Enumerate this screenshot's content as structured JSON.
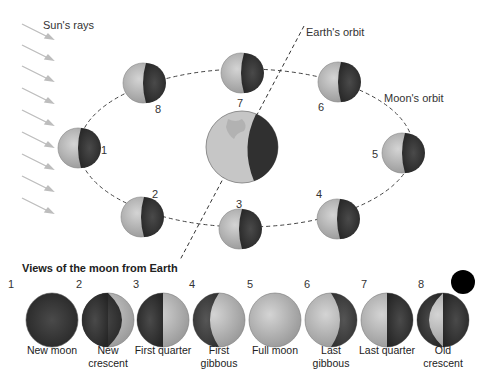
{
  "labels": {
    "suns_rays": "Sun's rays",
    "earths_orbit": "Earth's orbit",
    "moons_orbit": "Moon's orbit"
  },
  "orbit_positions": [
    {
      "number": "1",
      "lit_side": "left-half"
    },
    {
      "number": "2",
      "lit_side": "left-half"
    },
    {
      "number": "3",
      "lit_side": "left-half"
    },
    {
      "number": "4",
      "lit_side": "left-half"
    },
    {
      "number": "5",
      "lit_side": "left-half"
    },
    {
      "number": "6",
      "lit_side": "left-half"
    },
    {
      "number": "7",
      "lit_side": "left-half"
    },
    {
      "number": "8",
      "lit_side": "left-half"
    }
  ],
  "views": {
    "title": "Views of the moon from Earth",
    "phases": [
      {
        "number": "1",
        "name": "New moon"
      },
      {
        "number": "2",
        "name": "New crescent"
      },
      {
        "number": "3",
        "name": "First quarter"
      },
      {
        "number": "4",
        "name": "First gibbous"
      },
      {
        "number": "5",
        "name": "Full moon"
      },
      {
        "number": "6",
        "name": "Last gibbous"
      },
      {
        "number": "7",
        "name": "Last quarter"
      },
      {
        "number": "8",
        "name": "Old crescent"
      }
    ]
  },
  "colors": {
    "moon_lit": "#b8b8b8",
    "moon_dark": "#3a3a3a",
    "earth_light": "#c8c8c8",
    "earth_dark": "#333333",
    "rays": "#bbbbbb",
    "orbit": "#444444"
  }
}
